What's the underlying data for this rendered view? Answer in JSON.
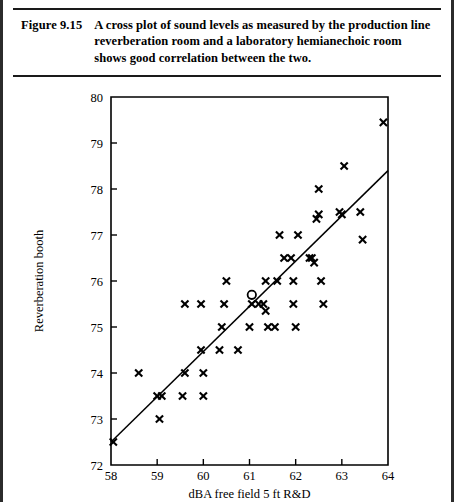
{
  "figure": {
    "label": "Figure 9.15",
    "caption": "A cross plot of sound levels as measured by the production line reverberation room and a laboratory hemianechoic room shows good correlation between the two."
  },
  "chart_data": {
    "type": "scatter",
    "title": "",
    "xlabel": "dBA free field 5 ft R&D",
    "ylabel": "Reverberation booth",
    "xlim": [
      58,
      64
    ],
    "ylim": [
      72,
      80
    ],
    "xticks": [
      58,
      59,
      60,
      61,
      62,
      63,
      64
    ],
    "yticks": [
      72,
      73,
      74,
      75,
      76,
      77,
      78,
      79,
      80
    ],
    "grid": false,
    "legend": "none",
    "series": [
      {
        "name": "measurements",
        "marker": "x",
        "points": [
          [
            58.05,
            72.5
          ],
          [
            58.6,
            74.0
          ],
          [
            59.0,
            73.5
          ],
          [
            59.1,
            73.5
          ],
          [
            59.05,
            73.0
          ],
          [
            59.55,
            73.5
          ],
          [
            59.6,
            74.0
          ],
          [
            59.6,
            75.5
          ],
          [
            59.95,
            75.5
          ],
          [
            59.95,
            74.5
          ],
          [
            60.0,
            74.0
          ],
          [
            60.0,
            73.5
          ],
          [
            60.35,
            74.5
          ],
          [
            60.4,
            75.0
          ],
          [
            60.45,
            75.5
          ],
          [
            60.5,
            76.0
          ],
          [
            60.75,
            74.5
          ],
          [
            61.0,
            75.0
          ],
          [
            61.05,
            75.5
          ],
          [
            61.2,
            75.5
          ],
          [
            61.3,
            75.5
          ],
          [
            61.35,
            75.35
          ],
          [
            61.35,
            76.0
          ],
          [
            61.4,
            75.0
          ],
          [
            61.55,
            75.0
          ],
          [
            61.6,
            76.0
          ],
          [
            61.65,
            77.0
          ],
          [
            61.75,
            76.5
          ],
          [
            61.9,
            76.5
          ],
          [
            61.95,
            76.0
          ],
          [
            61.95,
            75.5
          ],
          [
            62.0,
            75.0
          ],
          [
            62.05,
            77.0
          ],
          [
            62.3,
            76.5
          ],
          [
            62.35,
            76.5
          ],
          [
            62.4,
            76.4
          ],
          [
            62.45,
            77.35
          ],
          [
            62.5,
            78.0
          ],
          [
            62.5,
            77.45
          ],
          [
            62.55,
            76.0
          ],
          [
            62.6,
            75.5
          ],
          [
            62.95,
            77.5
          ],
          [
            63.0,
            77.45
          ],
          [
            63.05,
            78.5
          ],
          [
            63.4,
            77.5
          ],
          [
            63.45,
            76.9
          ],
          [
            63.9,
            79.45
          ]
        ]
      },
      {
        "name": "highlighted-sample",
        "marker": "o",
        "points": [
          [
            61.05,
            75.7
          ]
        ]
      }
    ],
    "fit_line": {
      "name": "correlation line",
      "x": [
        58.0,
        64.0
      ],
      "y": [
        72.5,
        78.4
      ]
    }
  }
}
